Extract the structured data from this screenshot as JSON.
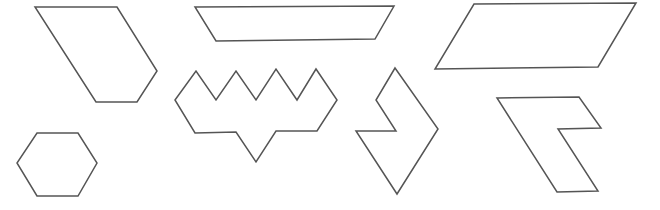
{
  "canvas": {
    "width": 660,
    "height": 210,
    "background": "#ffffff",
    "stroke": "#555555"
  },
  "shapes": [
    {
      "id": "hexagonal-slanted-quad",
      "name": "slanted-pentagon",
      "points": "35,7 117,7 157,71 137,102 96,102"
    },
    {
      "id": "trapezoid",
      "name": "trapezoid",
      "points": "195,7 394,6 375,39 216,41"
    },
    {
      "id": "parallelogram",
      "name": "parallelogram",
      "points": "474,4 636,3 598,67 435,69"
    },
    {
      "id": "crown",
      "name": "zigzag-crown",
      "points": "175,100 196,71 216,100 236,71 256,100 276,69 297,100 316,69 337,100 317,131 276,131 256,162 236,132 195,133"
    },
    {
      "id": "notched-rhombus",
      "name": "notched-rhombus",
      "points": "395,68 438,129 397,194 356,131 396,131 376,100"
    },
    {
      "id": "notched-parallelogram",
      "name": "notched-parallelogram",
      "points": "497,98 579,97 601,128 558,129 598,191 557,192"
    },
    {
      "id": "hexagon",
      "name": "hexagon",
      "points": "37,133 78,133 97,163 78,196 37,196 17,163"
    }
  ]
}
